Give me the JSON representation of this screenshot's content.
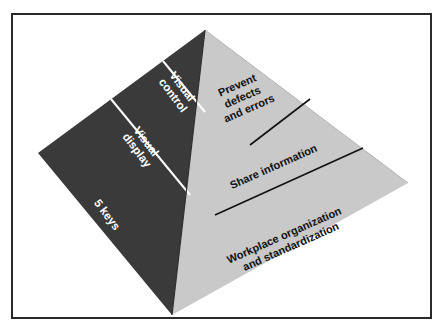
{
  "figure": {
    "background_color": "#ffffff",
    "frame_color": "#2a2a2a"
  },
  "pyramid": {
    "left_face": {
      "name": "five-keys-face",
      "fill_color": "#3a3a3a",
      "divider_color": "#ffffff",
      "text_color": "#ffffff",
      "tiers": [
        {
          "id": "visual-control",
          "lines": [
            "Visual",
            "control"
          ]
        },
        {
          "id": "visual-display",
          "lines": [
            "Visual",
            "display"
          ]
        },
        {
          "id": "five-keys",
          "lines": [
            "5 keys"
          ]
        }
      ]
    },
    "right_face": {
      "name": "objectives-face",
      "fill_color": "#c9c9c9",
      "divider_color": "#111111",
      "text_color": "#111111",
      "tiers": [
        {
          "id": "prevent-defects",
          "lines": [
            "Prevent",
            "defects",
            "and errors"
          ]
        },
        {
          "id": "share-information",
          "lines": [
            "Share information"
          ]
        },
        {
          "id": "workplace-organization",
          "lines": [
            "Workplace organization",
            "and standardization"
          ]
        }
      ]
    }
  }
}
